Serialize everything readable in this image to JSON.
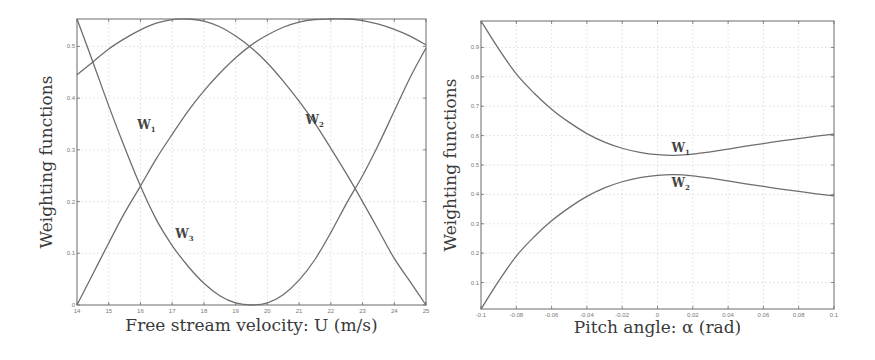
{
  "chart_data": [
    {
      "type": "line",
      "title": "",
      "xlabel": "Free stream velocity: U (m/s)",
      "ylabel": "Weighting functions",
      "xlim": [
        14,
        25
      ],
      "ylim": [
        0,
        0.553
      ],
      "xticks": [
        "14",
        "15",
        "16",
        "17",
        "18",
        "19",
        "20",
        "21",
        "22",
        "23",
        "24",
        "25"
      ],
      "yticks": [
        "0",
        "0.1",
        "0.2",
        "0.3",
        "0.4",
        "0.5"
      ],
      "grid": true,
      "x": [
        14,
        14.5,
        15,
        15.5,
        16,
        16.5,
        17,
        17.5,
        18,
        18.5,
        19,
        19.5,
        20,
        20.5,
        21,
        21.5,
        22,
        22.5,
        23,
        23.5,
        24,
        24.5,
        25
      ],
      "series": [
        {
          "name": "W1",
          "label": "W",
          "sub": "1",
          "values": [
            0.445,
            0.47,
            0.495,
            0.515,
            0.532,
            0.545,
            0.552,
            0.553,
            0.549,
            0.538,
            0.52,
            0.497,
            0.468,
            0.433,
            0.394,
            0.351,
            0.303,
            0.253,
            0.2,
            0.145,
            0.09,
            0.045,
            0.0
          ]
        },
        {
          "name": "W2",
          "label": "W",
          "sub": "2",
          "values": [
            0.0,
            0.06,
            0.12,
            0.178,
            0.23,
            0.283,
            0.33,
            0.375,
            0.414,
            0.448,
            0.478,
            0.503,
            0.522,
            0.537,
            0.547,
            0.552,
            0.553,
            0.553,
            0.55,
            0.543,
            0.533,
            0.52,
            0.503
          ]
        },
        {
          "name": "W3",
          "label": "W",
          "sub": "3",
          "values": [
            0.553,
            0.47,
            0.385,
            0.305,
            0.23,
            0.165,
            0.115,
            0.075,
            0.042,
            0.018,
            0.004,
            0.0,
            0.004,
            0.02,
            0.048,
            0.088,
            0.14,
            0.197,
            0.25,
            0.31,
            0.375,
            0.44,
            0.497
          ]
        }
      ],
      "annotations": [
        {
          "text": "W",
          "sub": "1",
          "x": 15.9,
          "y": 0.34
        },
        {
          "text": "W",
          "sub": "2",
          "x": 21.2,
          "y": 0.35
        },
        {
          "text": "W",
          "sub": "3",
          "x": 17.1,
          "y": 0.13
        }
      ]
    },
    {
      "type": "line",
      "title": "",
      "xlabel": "Pitch angle: α (rad)",
      "ylabel": "Weighting functions",
      "xlim": [
        -0.1,
        0.1
      ],
      "ylim": [
        0.01,
        0.99
      ],
      "xticks": [
        "-0.1",
        "-0.08",
        "-0.06",
        "-0.04",
        "-0.02",
        "0",
        "0.02",
        "0.04",
        "0.06",
        "0.08",
        "0.1"
      ],
      "yticks": [
        "0.1",
        "0.2",
        "0.3",
        "0.4",
        "0.5",
        "0.6",
        "0.7",
        "0.8",
        "0.9"
      ],
      "grid": true,
      "x": [
        -0.1,
        -0.09,
        -0.08,
        -0.07,
        -0.06,
        -0.05,
        -0.04,
        -0.03,
        -0.02,
        -0.01,
        0,
        0.01,
        0.02,
        0.03,
        0.04,
        0.05,
        0.06,
        0.07,
        0.08,
        0.09,
        0.1
      ],
      "series": [
        {
          "name": "W1",
          "label": "W",
          "sub": "1",
          "values": [
            0.99,
            0.895,
            0.81,
            0.745,
            0.69,
            0.645,
            0.607,
            0.578,
            0.557,
            0.543,
            0.535,
            0.533,
            0.537,
            0.545,
            0.554,
            0.564,
            0.573,
            0.582,
            0.59,
            0.598,
            0.605
          ]
        },
        {
          "name": "W2",
          "label": "W",
          "sub": "2",
          "values": [
            0.01,
            0.105,
            0.19,
            0.255,
            0.31,
            0.355,
            0.393,
            0.422,
            0.443,
            0.457,
            0.465,
            0.467,
            0.463,
            0.455,
            0.446,
            0.436,
            0.427,
            0.418,
            0.41,
            0.402,
            0.395
          ]
        }
      ],
      "annotations": [
        {
          "text": "W",
          "sub": "1",
          "x": 0.008,
          "y": 0.545
        },
        {
          "text": "W",
          "sub": "2",
          "x": 0.008,
          "y": 0.425
        }
      ]
    }
  ]
}
